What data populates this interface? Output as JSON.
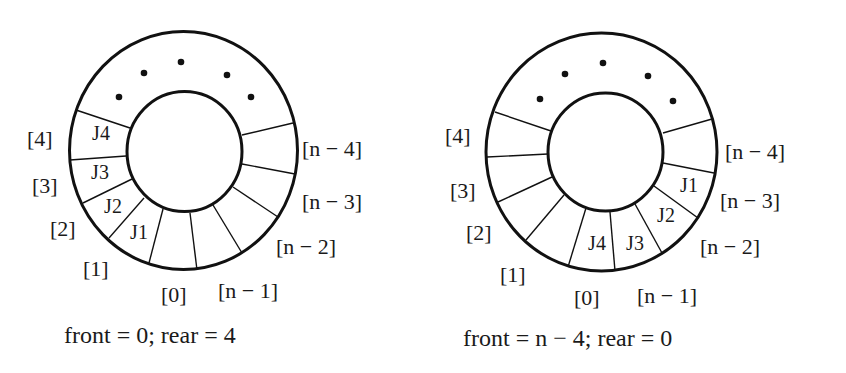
{
  "colors": {
    "ink": "#111111",
    "background": "#ffffff"
  },
  "diagrams": [
    {
      "name": "queue-left",
      "caption": "front = 0; rear = 4",
      "ellipsis": "• • • • •",
      "index_labels": {
        "i4": "[4]",
        "i3": "[3]",
        "i2": "[2]",
        "i1": "[1]",
        "i0": "[0]",
        "n1": "[n − 1]",
        "n2": "[n − 2]",
        "n3": "[n − 3]",
        "n4": "[n − 4]"
      },
      "jobs": {
        "J1": "J1",
        "J2": "J2",
        "J3": "J3",
        "J4": "J4"
      },
      "front": "0",
      "rear": "4"
    },
    {
      "name": "queue-right",
      "caption": "front = n − 4; rear = 0",
      "ellipsis": "• • • • •",
      "index_labels": {
        "i4": "[4]",
        "i3": "[3]",
        "i2": "[2]",
        "i1": "[1]",
        "i0": "[0]",
        "n1": "[n − 1]",
        "n2": "[n − 2]",
        "n3": "[n − 3]",
        "n4": "[n − 4]"
      },
      "jobs": {
        "J1": "J1",
        "J2": "J2",
        "J3": "J3",
        "J4": "J4"
      },
      "front": "n − 4",
      "rear": "0"
    }
  ]
}
